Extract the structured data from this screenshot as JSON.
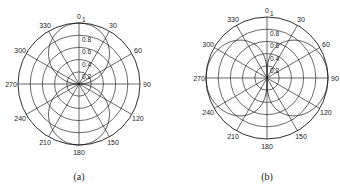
{
  "chart_data": [
    {
      "type": "polar",
      "caption": "(a)",
      "center": [
        79,
        84
      ],
      "radius": 61,
      "radial_ticks": [
        "0.2",
        "0.4",
        "0.6",
        "0.8",
        "1"
      ],
      "radial_values": [
        0.2,
        0.4,
        0.6,
        0.8,
        1.0
      ],
      "angle_ticks": [
        "0",
        "30",
        "60",
        "90",
        "120",
        "150",
        "180",
        "210",
        "240",
        "270",
        "300",
        "330"
      ],
      "angle_direction": "clockwise, 0 at top",
      "pattern": "|cos(theta)|",
      "description": "Figure-eight radiation pattern with lobes along 0 and 180 degrees",
      "series": [
        {
          "name": "pattern",
          "theta_deg": [
            0,
            30,
            60,
            90,
            120,
            150,
            180,
            210,
            240,
            270,
            300,
            330
          ],
          "r": [
            1.0,
            0.87,
            0.5,
            0.0,
            0.5,
            0.87,
            1.0,
            0.87,
            0.5,
            0.0,
            0.5,
            0.87
          ]
        }
      ]
    },
    {
      "type": "polar",
      "caption": "(b)",
      "center": [
        267,
        78
      ],
      "radius": 61,
      "radial_ticks": [
        "0.2",
        "0.4",
        "0.6",
        "0.8",
        "1"
      ],
      "radial_values": [
        0.2,
        0.4,
        0.6,
        0.8,
        1.0
      ],
      "angle_ticks": [
        "0",
        "30",
        "60",
        "90",
        "120",
        "150",
        "180",
        "210",
        "240",
        "270",
        "300",
        "330"
      ],
      "angle_direction": "clockwise, 0 at top",
      "pattern": "sqrt(|sin(theta)|)",
      "description": "Broad figure-eight radiation pattern with lobes along 90 and 270 degrees",
      "series": [
        {
          "name": "pattern",
          "theta_deg": [
            0,
            30,
            60,
            90,
            120,
            150,
            180,
            210,
            240,
            270,
            300,
            330
          ],
          "r": [
            0.0,
            0.71,
            0.93,
            1.0,
            0.93,
            0.71,
            0.0,
            0.71,
            0.93,
            1.0,
            0.93,
            0.71
          ]
        }
      ]
    }
  ],
  "captions": [
    "(a)",
    "(b)"
  ]
}
